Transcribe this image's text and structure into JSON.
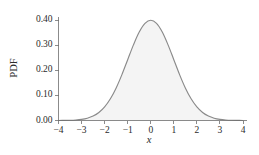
{
  "chart_data": {
    "type": "line",
    "title": "",
    "subtitle": "",
    "xlabel": "x",
    "ylabel": "PDF",
    "xlim": [
      -4,
      4
    ],
    "ylim": [
      0.0,
      0.4
    ],
    "grid": false,
    "legend": null,
    "legend_position": "none",
    "fill_under_curve": true,
    "xticks": [
      -4,
      -3,
      -2,
      -1,
      0,
      1,
      2,
      3,
      4
    ],
    "xtick_labels": [
      "−4",
      "−3",
      "−2",
      "−1",
      "0",
      "1",
      "2",
      "3",
      "4"
    ],
    "yticks": [
      0.0,
      0.1,
      0.2,
      0.3,
      0.4
    ],
    "ytick_labels": [
      "0.00",
      "0.10",
      "0.20",
      "0.30",
      "0.40"
    ],
    "series": [
      {
        "name": "Standard normal PDF",
        "distribution": "normal",
        "mean": 0,
        "sd": 1,
        "peak_value": 0.3989,
        "x": [
          -4.0,
          -3.75,
          -3.5,
          -3.25,
          -3.0,
          -2.75,
          -2.5,
          -2.25,
          -2.0,
          -1.75,
          -1.5,
          -1.25,
          -1.0,
          -0.75,
          -0.5,
          -0.25,
          0.0,
          0.25,
          0.5,
          0.75,
          1.0,
          1.25,
          1.5,
          1.75,
          2.0,
          2.25,
          2.5,
          2.75,
          3.0,
          3.25,
          3.5,
          3.75,
          4.0
        ],
        "values": [
          0.0001,
          0.0004,
          0.0009,
          0.002,
          0.0044,
          0.0091,
          0.0175,
          0.0317,
          0.054,
          0.0863,
          0.1295,
          0.1826,
          0.242,
          0.3011,
          0.3521,
          0.3867,
          0.3989,
          0.3867,
          0.3521,
          0.3011,
          0.242,
          0.1826,
          0.1295,
          0.0863,
          0.054,
          0.0317,
          0.0175,
          0.0091,
          0.0044,
          0.002,
          0.0009,
          0.0004,
          0.0001
        ]
      }
    ],
    "colors": {
      "curve": "#8a8a8a",
      "fill": "#f4f4f4",
      "axis": "#6e6e6e",
      "text": "#2b2b2b",
      "background": "#ffffff"
    }
  }
}
